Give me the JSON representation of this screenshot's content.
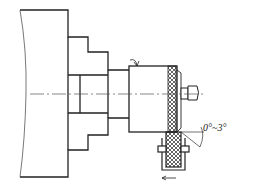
{
  "diagram": {
    "angle_label": "0°~3°",
    "colors": {
      "line": "#222222",
      "thin": "#555555",
      "background": "#ffffff"
    }
  }
}
